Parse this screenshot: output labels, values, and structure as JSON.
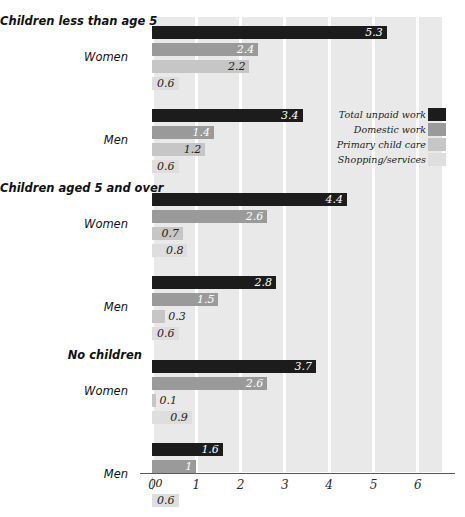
{
  "chart_data": {
    "type": "bar",
    "orientation": "horizontal",
    "title": "",
    "xlabel": "",
    "ylabel": "",
    "xlim": [
      0,
      6.55
    ],
    "xticks": [
      0,
      1,
      2,
      3,
      4,
      5,
      6
    ],
    "xtick_labels": [
      "0",
      "1",
      "2",
      "3",
      "4",
      "5",
      "6"
    ],
    "grid": true,
    "grid_axis": "x",
    "legend_position": "inside-right",
    "series": [
      {
        "name": "Total unpaid work",
        "color": "#1c1c1c"
      },
      {
        "name": "Domestic work",
        "color": "#9a9a9a"
      },
      {
        "name": "Primary child care",
        "color": "#c6c6c6"
      },
      {
        "name": "Shopping/services",
        "color": "#dedede"
      }
    ],
    "groups": [
      {
        "header": "Children less than age 5",
        "subgroups": [
          {
            "label": "Women",
            "values": [
              5.3,
              2.4,
              2.2,
              0.6
            ],
            "value_labels": [
              "5.3",
              "2.4",
              "2.2",
              "0.6"
            ]
          },
          {
            "label": "Men",
            "values": [
              3.4,
              1.4,
              1.2,
              0.6
            ],
            "value_labels": [
              "3.4",
              "1.4",
              "1.2",
              "0.6"
            ]
          }
        ]
      },
      {
        "header": "Children aged 5 and over",
        "subgroups": [
          {
            "label": "Women",
            "values": [
              4.4,
              2.6,
              0.7,
              0.8
            ],
            "value_labels": [
              "4.4",
              "2.6",
              "0.7",
              "0.8"
            ]
          },
          {
            "label": "Men",
            "values": [
              2.8,
              1.5,
              0.3,
              0.6
            ],
            "value_labels": [
              "2.8",
              "1.5",
              "0.3",
              "0.6"
            ]
          }
        ]
      },
      {
        "header": "No children",
        "subgroups": [
          {
            "label": "Women",
            "values": [
              3.7,
              2.6,
              0.1,
              0.9
            ],
            "value_labels": [
              "3.7",
              "2.6",
              "0.1",
              "0.9"
            ]
          },
          {
            "label": "Men",
            "values": [
              1.6,
              1.0,
              0.0,
              0.6
            ],
            "value_labels": [
              "1.6",
              "1",
              "0",
              "0.6"
            ]
          }
        ]
      }
    ]
  },
  "legend": {
    "items": [
      {
        "label": "Total unpaid work",
        "color": "#1c1c1c"
      },
      {
        "label": "Domestic work",
        "color": "#9a9a9a"
      },
      {
        "label": "Primary child care",
        "color": "#c6c6c6"
      },
      {
        "label": "Shopping/services",
        "color": "#dedede"
      }
    ]
  }
}
